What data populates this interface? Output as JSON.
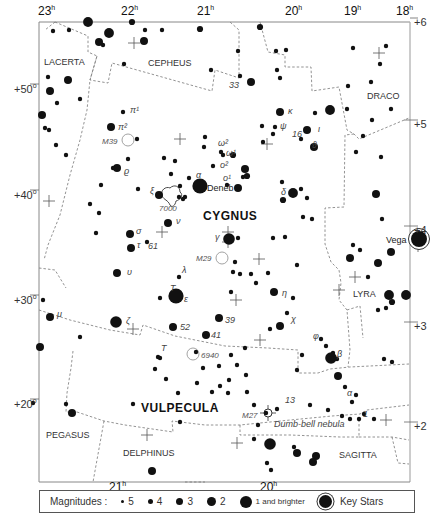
{
  "map": {
    "title": "Cygnus star chart",
    "frame": {
      "left": 39,
      "top": 22,
      "right": 410,
      "bottom": 482
    }
  },
  "ra_labels_top": [
    {
      "text": "23",
      "unit": "h",
      "x": 38,
      "y": 4
    },
    {
      "text": "22",
      "unit": "h",
      "x": 121,
      "y": 4
    },
    {
      "text": "21",
      "unit": "h",
      "x": 197,
      "y": 4
    },
    {
      "text": "20",
      "unit": "h",
      "x": 285,
      "y": 4
    },
    {
      "text": "19",
      "unit": "h",
      "x": 344,
      "y": 4
    },
    {
      "text": "18",
      "unit": "h",
      "x": 396,
      "y": 4
    }
  ],
  "ra_labels_bottom": [
    {
      "text": "21",
      "unit": "h",
      "x": 109,
      "y": 480
    },
    {
      "text": "20",
      "unit": "h",
      "x": 260,
      "y": 480
    }
  ],
  "dec_labels_left": [
    {
      "text": "+50",
      "unit": "o",
      "x": 14,
      "y": 82
    },
    {
      "text": "+40",
      "unit": "o",
      "x": 14,
      "y": 188
    },
    {
      "text": "+30",
      "unit": "o",
      "x": 14,
      "y": 293
    },
    {
      "text": "+20",
      "unit": "o",
      "x": 14,
      "y": 397
    }
  ],
  "dec_labels_right": [
    {
      "text": "+6",
      "x": 414,
      "y": 16
    },
    {
      "text": "+5",
      "x": 414,
      "y": 118
    },
    {
      "text": "+4",
      "x": 414,
      "y": 224
    },
    {
      "text": "+3",
      "x": 414,
      "y": 320
    },
    {
      "text": "+2",
      "x": 414,
      "y": 420
    }
  ],
  "constellations": [
    {
      "name": "LACERTA",
      "x": 44,
      "y": 65,
      "size": 9,
      "bold": false
    },
    {
      "name": "CEPHEUS",
      "x": 148,
      "y": 66,
      "size": 9,
      "bold": false
    },
    {
      "name": "DRACO",
      "x": 367,
      "y": 99,
      "size": 9,
      "bold": false
    },
    {
      "name": "CYGNUS",
      "x": 203,
      "y": 220,
      "size": 12,
      "bold": true
    },
    {
      "name": "LYRA",
      "x": 353,
      "y": 297,
      "size": 9,
      "bold": false
    },
    {
      "name": "VULPECULA",
      "x": 141,
      "y": 412,
      "size": 12,
      "bold": true
    },
    {
      "name": "PEGASUS",
      "x": 46,
      "y": 438,
      "size": 9,
      "bold": false
    },
    {
      "name": "DELPHINUS",
      "x": 123,
      "y": 456,
      "size": 9,
      "bold": false
    },
    {
      "name": "SAGITTA",
      "x": 339,
      "y": 458,
      "size": 9,
      "bold": false
    }
  ],
  "named_stars": [
    {
      "name": "Deneb",
      "x": 207,
      "y": 191
    },
    {
      "name": "Vega",
      "x": 386,
      "y": 243
    }
  ],
  "greek_labels": [
    {
      "text": "π¹",
      "x": 130,
      "y": 113
    },
    {
      "text": "π²",
      "x": 118,
      "y": 130
    },
    {
      "text": "ϱ",
      "x": 124,
      "y": 174
    },
    {
      "text": "ξ",
      "x": 150,
      "y": 194
    },
    {
      "text": "α",
      "x": 196,
      "y": 178
    },
    {
      "text": "ν",
      "x": 176,
      "y": 224
    },
    {
      "text": "σ",
      "x": 136,
      "y": 234
    },
    {
      "text": "τ",
      "x": 137,
      "y": 248
    },
    {
      "text": "61",
      "x": 148,
      "y": 249
    },
    {
      "text": "ω²",
      "x": 218,
      "y": 146
    },
    {
      "text": "ω¹",
      "x": 226,
      "y": 156
    },
    {
      "text": "ψ",
      "x": 280,
      "y": 129
    },
    {
      "text": "16",
      "x": 292,
      "y": 137
    },
    {
      "text": "ϑ",
      "x": 312,
      "y": 148
    },
    {
      "text": "ι",
      "x": 318,
      "y": 132
    },
    {
      "text": "κ",
      "x": 288,
      "y": 114
    },
    {
      "text": "33",
      "x": 229,
      "y": 88
    },
    {
      "text": "ο²",
      "x": 220,
      "y": 168
    },
    {
      "text": "ο¹",
      "x": 223,
      "y": 181
    },
    {
      "text": "δ",
      "x": 281,
      "y": 195
    },
    {
      "text": "γ",
      "x": 215,
      "y": 240
    },
    {
      "text": "λ",
      "x": 182,
      "y": 273
    },
    {
      "text": "T",
      "x": 170,
      "y": 291
    },
    {
      "text": "ε",
      "x": 184,
      "y": 302
    },
    {
      "text": "υ",
      "x": 127,
      "y": 275
    },
    {
      "text": "ζ",
      "x": 126,
      "y": 324
    },
    {
      "text": "μ",
      "x": 57,
      "y": 317
    },
    {
      "text": "52",
      "x": 180,
      "y": 330
    },
    {
      "text": "39",
      "x": 225,
      "y": 323
    },
    {
      "text": "41",
      "x": 211,
      "y": 338
    },
    {
      "text": "η",
      "x": 282,
      "y": 296
    },
    {
      "text": "χ",
      "x": 291,
      "y": 322
    },
    {
      "text": "φ",
      "x": 313,
      "y": 339
    },
    {
      "text": "β",
      "x": 337,
      "y": 357
    },
    {
      "text": "T",
      "x": 161,
      "y": 351
    },
    {
      "text": "α",
      "x": 347,
      "y": 396
    },
    {
      "text": "13",
      "x": 285,
      "y": 403
    },
    {
      "text": "1",
      "x": 363,
      "y": 417
    }
  ],
  "deep_sky": [
    {
      "id": "M39",
      "label": "M39",
      "x": 128,
      "y": 140,
      "r": 6,
      "labelX": 102,
      "labelY": 144
    },
    {
      "id": "7000",
      "label": "7000",
      "x": 172,
      "y": 205,
      "r": 0,
      "labelX": 159,
      "labelY": 211
    },
    {
      "id": "M29",
      "label": "M29",
      "x": 222,
      "y": 258,
      "r": 6,
      "labelX": 196,
      "labelY": 261
    },
    {
      "id": "6940",
      "label": "6940",
      "x": 193,
      "y": 354,
      "r": 6,
      "labelX": 201,
      "labelY": 358
    },
    {
      "id": "M27",
      "label": "M27",
      "x": 268,
      "y": 413,
      "r": 4,
      "labelX": 242,
      "labelY": 418
    }
  ],
  "annotations": [
    {
      "text": "Dumb-bell nebula",
      "x": 274,
      "y": 427
    }
  ],
  "stars": [
    [
      88,
      22,
      5
    ],
    [
      132,
      22,
      3
    ],
    [
      145,
      30,
      2
    ],
    [
      200,
      29,
      3
    ],
    [
      260,
      27,
      3
    ],
    [
      53,
      31,
      2
    ],
    [
      69,
      30,
      2
    ],
    [
      109,
      33,
      5
    ],
    [
      99,
      42,
      4
    ],
    [
      103,
      45,
      2
    ],
    [
      144,
      41,
      4
    ],
    [
      162,
      30,
      2
    ],
    [
      124,
      64,
      2
    ],
    [
      211,
      70,
      2
    ],
    [
      238,
      51,
      2
    ],
    [
      240,
      76,
      2
    ],
    [
      251,
      82,
      4
    ],
    [
      276,
      51,
      2
    ],
    [
      286,
      50,
      2
    ],
    [
      277,
      70,
      2
    ],
    [
      280,
      78,
      2
    ],
    [
      353,
      48,
      2
    ],
    [
      386,
      46,
      2
    ],
    [
      380,
      64,
      2
    ],
    [
      371,
      82,
      2
    ],
    [
      348,
      86,
      2
    ],
    [
      347,
      109,
      2
    ],
    [
      391,
      109,
      2
    ],
    [
      330,
      110,
      5
    ],
    [
      48,
      77,
      2
    ],
    [
      68,
      80,
      4
    ],
    [
      50,
      91,
      4
    ],
    [
      57,
      103,
      2
    ],
    [
      80,
      99,
      2
    ],
    [
      42,
      115,
      4
    ],
    [
      45,
      128,
      2
    ],
    [
      123,
      112,
      2
    ],
    [
      111,
      127,
      4
    ],
    [
      137,
      139,
      2
    ],
    [
      49,
      130,
      2
    ],
    [
      56,
      145,
      2
    ],
    [
      66,
      155,
      2
    ],
    [
      117,
      168,
      4
    ],
    [
      113,
      168,
      2
    ],
    [
      128,
      159,
      2
    ],
    [
      164,
      158,
      2
    ],
    [
      175,
      161,
      2
    ],
    [
      171,
      174,
      2
    ],
    [
      101,
      185,
      2
    ],
    [
      138,
      189,
      2
    ],
    [
      159,
      195,
      4
    ],
    [
      189,
      178,
      2
    ],
    [
      180,
      186,
      2
    ],
    [
      200,
      186,
      8
    ],
    [
      185,
      197,
      2
    ],
    [
      179,
      197,
      2
    ],
    [
      183,
      199,
      2
    ],
    [
      90,
      204,
      2
    ],
    [
      99,
      213,
      2
    ],
    [
      168,
      223,
      4
    ],
    [
      96,
      233,
      2
    ],
    [
      130,
      234,
      4
    ],
    [
      131,
      248,
      4
    ],
    [
      147,
      242,
      2
    ],
    [
      205,
      137,
      2
    ],
    [
      221,
      152,
      2
    ],
    [
      223,
      155,
      2
    ],
    [
      233,
      155,
      3
    ],
    [
      204,
      147,
      2
    ],
    [
      213,
      166,
      2
    ],
    [
      245,
      169,
      4
    ],
    [
      247,
      176,
      3
    ],
    [
      243,
      177,
      2
    ],
    [
      238,
      188,
      4
    ],
    [
      227,
      185,
      2
    ],
    [
      307,
      130,
      4
    ],
    [
      301,
      139,
      2
    ],
    [
      314,
      147,
      4
    ],
    [
      262,
      126,
      2
    ],
    [
      273,
      134,
      2
    ],
    [
      275,
      127,
      2
    ],
    [
      280,
      112,
      4
    ],
    [
      315,
      113,
      2
    ],
    [
      263,
      142,
      2
    ],
    [
      293,
      193,
      5
    ],
    [
      301,
      189,
      2
    ],
    [
      307,
      198,
      2
    ],
    [
      303,
      217,
      2
    ],
    [
      312,
      219,
      2
    ],
    [
      282,
      182,
      2
    ],
    [
      283,
      200,
      3
    ],
    [
      372,
      120,
      2
    ],
    [
      363,
      136,
      2
    ],
    [
      356,
      152,
      2
    ],
    [
      381,
      157,
      2
    ],
    [
      376,
      194,
      4
    ],
    [
      382,
      219,
      2
    ],
    [
      229,
      239,
      6
    ],
    [
      238,
      238,
      2
    ],
    [
      273,
      238,
      2
    ],
    [
      285,
      237,
      2
    ],
    [
      179,
      277,
      2
    ],
    [
      178,
      293,
      3
    ],
    [
      176,
      296,
      8
    ],
    [
      160,
      298,
      2
    ],
    [
      235,
      262,
      2
    ],
    [
      233,
      272,
      2
    ],
    [
      240,
      274,
      2
    ],
    [
      251,
      274,
      2
    ],
    [
      268,
      273,
      2
    ],
    [
      256,
      283,
      2
    ],
    [
      231,
      292,
      2
    ],
    [
      274,
      292,
      4
    ],
    [
      297,
      265,
      2
    ],
    [
      293,
      298,
      2
    ],
    [
      353,
      245,
      2
    ],
    [
      360,
      250,
      2
    ],
    [
      350,
      258,
      4
    ],
    [
      391,
      252,
      4
    ],
    [
      378,
      263,
      4
    ],
    [
      368,
      277,
      2
    ],
    [
      406,
      295,
      5
    ],
    [
      389,
      295,
      5
    ],
    [
      392,
      302,
      3
    ],
    [
      386,
      308,
      2
    ],
    [
      378,
      310,
      2
    ],
    [
      117,
      273,
      4
    ],
    [
      116,
      322,
      6
    ],
    [
      43,
      300,
      2
    ],
    [
      50,
      317,
      4
    ],
    [
      40,
      347,
      4
    ],
    [
      80,
      337,
      2
    ],
    [
      173,
      327,
      4
    ],
    [
      219,
      318,
      4
    ],
    [
      206,
      335,
      4
    ],
    [
      280,
      326,
      4
    ],
    [
      287,
      313,
      2
    ],
    [
      321,
      339,
      2
    ],
    [
      326,
      346,
      2
    ],
    [
      333,
      353,
      2
    ],
    [
      337,
      359,
      2
    ],
    [
      331,
      358,
      6
    ],
    [
      270,
      329,
      2
    ],
    [
      245,
      348,
      2
    ],
    [
      231,
      355,
      2
    ],
    [
      302,
      355,
      2
    ],
    [
      237,
      365,
      2
    ],
    [
      246,
      375,
      2
    ],
    [
      297,
      370,
      2
    ],
    [
      219,
      366,
      2
    ],
    [
      160,
      358,
      2
    ],
    [
      158,
      357,
      2
    ],
    [
      155,
      369,
      2
    ],
    [
      166,
      379,
      2
    ],
    [
      178,
      393,
      2
    ],
    [
      196,
      352,
      2
    ],
    [
      203,
      368,
      2
    ],
    [
      212,
      392,
      2
    ],
    [
      220,
      386,
      2
    ],
    [
      229,
      380,
      2
    ],
    [
      228,
      393,
      2
    ],
    [
      247,
      392,
      2
    ],
    [
      345,
      387,
      2
    ],
    [
      338,
      376,
      4
    ],
    [
      352,
      402,
      2
    ],
    [
      350,
      419,
      2
    ],
    [
      359,
      419,
      2
    ],
    [
      33,
      403,
      2
    ],
    [
      72,
      413,
      4
    ],
    [
      66,
      404,
      2
    ],
    [
      133,
      404,
      2
    ],
    [
      180,
      422,
      2
    ],
    [
      197,
      383,
      2
    ],
    [
      152,
      471,
      4
    ],
    [
      254,
      405,
      2
    ],
    [
      266,
      413,
      2
    ],
    [
      258,
      425,
      2
    ],
    [
      277,
      409,
      2
    ],
    [
      310,
      405,
      2
    ],
    [
      328,
      410,
      2
    ],
    [
      254,
      439,
      2
    ],
    [
      270,
      444,
      6
    ],
    [
      294,
      447,
      2
    ],
    [
      297,
      453,
      4
    ],
    [
      316,
      456,
      4
    ],
    [
      313,
      462,
      4
    ],
    [
      267,
      463,
      2
    ],
    [
      271,
      470,
      2
    ],
    [
      384,
      359,
      2
    ],
    [
      356,
      395,
      2
    ],
    [
      374,
      419,
      2
    ],
    [
      392,
      362,
      2
    ],
    [
      364,
      414,
      2
    ],
    [
      342,
      416,
      2
    ]
  ],
  "key_stars": [
    {
      "name": "Vega",
      "x": 419,
      "y": 239,
      "r": 8
    }
  ],
  "grid_crosses": [
    [
      134,
      43
    ],
    [
      379,
      53
    ],
    [
      180,
      139
    ],
    [
      267,
      144
    ],
    [
      49,
      201
    ],
    [
      162,
      232
    ],
    [
      228,
      232
    ],
    [
      228,
      242
    ],
    [
      259,
      259
    ],
    [
      236,
      300
    ],
    [
      339,
      290
    ],
    [
      133,
      329
    ],
    [
      260,
      340
    ],
    [
      147,
      435
    ],
    [
      237,
      443
    ],
    [
      386,
      420
    ],
    [
      418,
      246
    ],
    [
      355,
      277
    ]
  ],
  "legend": {
    "title": "Magnitudes :",
    "items": [
      {
        "label": "5",
        "size": 3
      },
      {
        "label": "4",
        "size": 5
      },
      {
        "label": "3",
        "size": 7
      },
      {
        "label": "2",
        "size": 9
      },
      {
        "label": "1 and brighter",
        "size": 12
      }
    ],
    "key_label": "Key Stars"
  }
}
